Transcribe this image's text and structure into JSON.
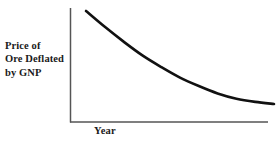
{
  "chart_data": {
    "type": "line",
    "title": "",
    "subtitle": "",
    "xlabel": "Year",
    "ylabel": "Price of Ore Deflated by GNP",
    "ylabel_lines": [
      "Price of",
      "Ore Deflated",
      "by GNP"
    ],
    "xtick_labels": [],
    "ytick_labels": [],
    "grid": false,
    "legend": null,
    "annotations": [],
    "axis_style": {
      "spines": [
        "left",
        "bottom"
      ],
      "color": "#555555",
      "width_px": 1.5,
      "ticks": "none"
    },
    "series": [
      {
        "name": "Price of Ore Deflated by GNP",
        "color": "#111111",
        "width_px": 2.6,
        "description": "Smooth decaying exponential declining from upper left and flattening to a horizontal asymptote at the right",
        "x": [
          0,
          10,
          20,
          30,
          40,
          50,
          60,
          70,
          80,
          90,
          100
        ],
        "y": [
          100,
          85,
          71,
          58,
          47,
          37,
          29,
          22,
          17,
          14,
          12
        ]
      }
    ],
    "xlim": [
      0,
      100
    ],
    "ylim": [
      0,
      110
    ]
  },
  "figure": {
    "background": "#ffffff",
    "ink_color": "#1a1a1a",
    "width_px": 276,
    "height_px": 142
  }
}
